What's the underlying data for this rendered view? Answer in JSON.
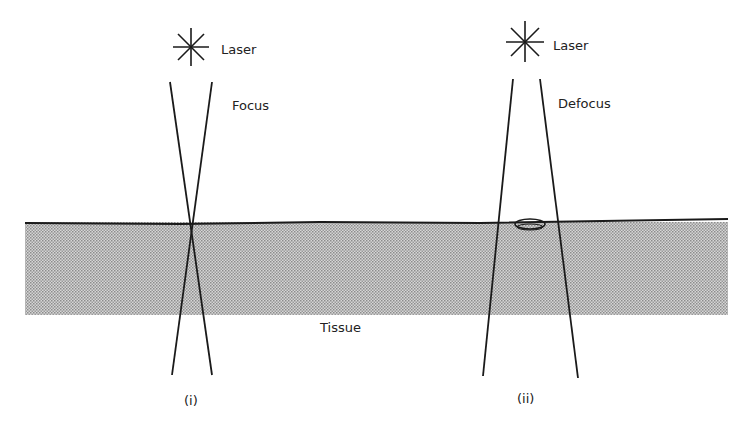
{
  "diagram": {
    "panel_i": {
      "source_label": "Laser",
      "mode_label": "Focus",
      "caption": "(i)"
    },
    "panel_ii": {
      "source_label": "Laser",
      "mode_label": "Defocus",
      "caption": "(ii)"
    },
    "medium_label": "Tissue",
    "colors": {
      "line": "#1a1a1a",
      "tissue_fill": "#b8b8b8",
      "background": "#ffffff"
    }
  }
}
